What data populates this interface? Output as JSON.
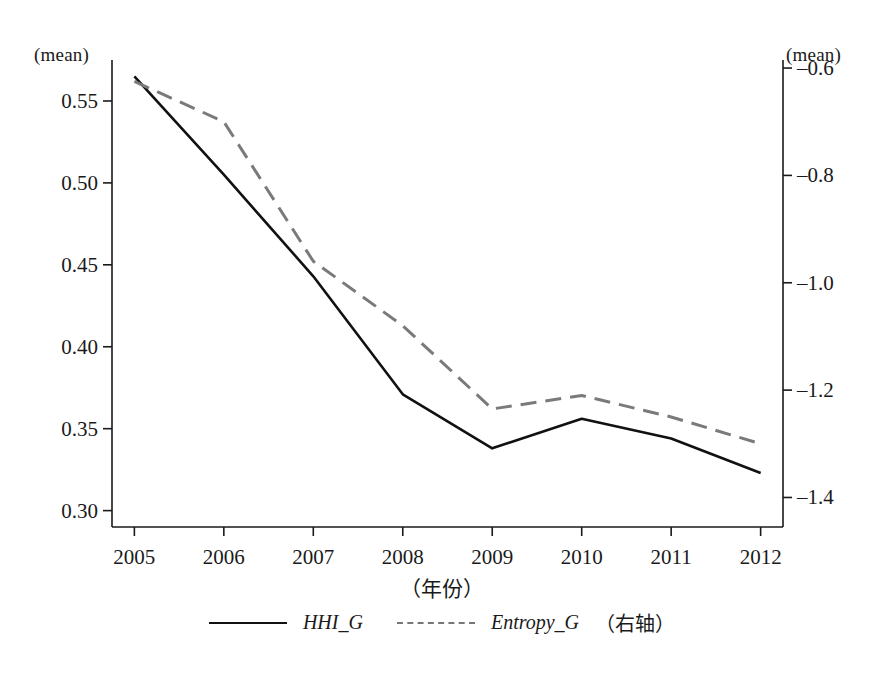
{
  "chart_data": {
    "type": "line",
    "title": "",
    "xlabel": "（年份）",
    "ylabel": "(mean)",
    "y2label": "(mean)",
    "x": [
      2005,
      2006,
      2007,
      2008,
      2009,
      2010,
      2011,
      2012
    ],
    "xticklabels": [
      "2005",
      "2006",
      "2007",
      "2008",
      "2009",
      "2010",
      "2011",
      "2012"
    ],
    "xlim": [
      2004.75,
      2012.25
    ],
    "ylim": [
      0.29,
      0.575
    ],
    "yticks": [
      0.3,
      0.35,
      0.4,
      0.45,
      0.5,
      0.55
    ],
    "yticklabels": [
      "0.30",
      "0.35",
      "0.40",
      "0.45",
      "0.50",
      "0.55"
    ],
    "y2lim": [
      -1.455,
      -0.585
    ],
    "y2ticks": [
      -0.6,
      -0.8,
      -1.0,
      -1.2,
      -1.4
    ],
    "y2ticklabels": [
      "–0.6",
      "–0.8",
      "–1.0",
      "–1.2",
      "–1.4"
    ],
    "grid": false,
    "legend_position": "bottom",
    "series": [
      {
        "name": "HHI_G",
        "axis": "left",
        "style": "solid",
        "color": "#111111",
        "values": [
          0.565,
          0.505,
          0.443,
          0.371,
          0.338,
          0.356,
          0.344,
          0.323
        ]
      },
      {
        "name": "Entropy_G",
        "axis": "right",
        "style": "dashed",
        "color": "#7a7a7a",
        "values": [
          -0.625,
          -0.7,
          -0.96,
          -1.08,
          -1.235,
          -1.21,
          -1.25,
          -1.3
        ]
      }
    ]
  },
  "legend": {
    "items": [
      {
        "label": "HHI_G",
        "note": ""
      },
      {
        "label": "Entropy_G",
        "note": "（右轴）"
      }
    ]
  }
}
